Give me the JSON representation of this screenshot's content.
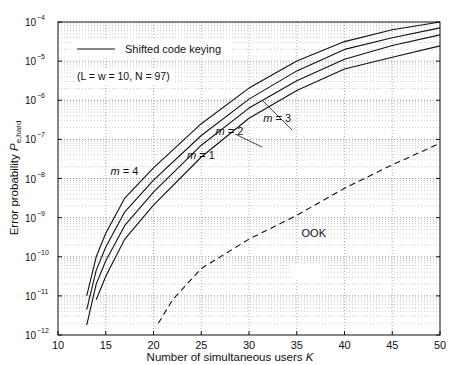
{
  "chart_data": {
    "type": "line",
    "title": "",
    "xlabel": "Number of simultaneous users",
    "xlabel_var": "K",
    "ylabel": "Error probability",
    "ylabel_var": "P",
    "ylabel_sub": "e,hard",
    "xlim": [
      10,
      50
    ],
    "ylim": [
      1e-12,
      0.0001
    ],
    "yscale": "log",
    "x_ticks": [
      10,
      15,
      20,
      25,
      30,
      35,
      40,
      45,
      50
    ],
    "y_tick_exponents": [
      -4,
      -5,
      -6,
      -7,
      -8,
      -9,
      -10,
      -11,
      -12
    ],
    "grid": true,
    "legend": {
      "entries": [
        {
          "label": "Shifted code keying",
          "style": "solid"
        }
      ],
      "params_note": "(L = w = 10, N = 97)",
      "position": "upper-left"
    },
    "series": [
      {
        "name": "m = 4",
        "style": "solid",
        "label_pos": [
          15.5,
          -7.9
        ],
        "x": [
          13,
          14,
          15,
          17,
          20,
          25,
          30,
          35,
          40,
          45,
          50
        ],
        "log10_y": [
          -11.0,
          -10.0,
          -9.4,
          -8.5,
          -7.73,
          -6.6,
          -5.69,
          -5.0,
          -4.5,
          -4.2,
          -4.0
        ]
      },
      {
        "name": "m = 3",
        "style": "solid",
        "label_pos": [
          31.5,
          -6.55
        ],
        "x": [
          13,
          14,
          15,
          17,
          20,
          25,
          30,
          35,
          40,
          45,
          50
        ],
        "log10_y": [
          -11.35,
          -10.35,
          -9.75,
          -8.85,
          -8.04,
          -6.9,
          -5.97,
          -5.25,
          -4.7,
          -4.4,
          -4.15
        ]
      },
      {
        "name": "m = 2",
        "style": "solid",
        "label_pos": [
          26.5,
          -6.9
        ],
        "x": [
          13,
          14,
          15,
          17,
          20,
          25,
          30,
          35,
          40,
          45,
          50
        ],
        "log10_y": [
          -11.75,
          -10.7,
          -10.1,
          -9.2,
          -8.35,
          -7.15,
          -6.2,
          -5.5,
          -4.95,
          -4.6,
          -4.33
        ]
      },
      {
        "name": "m = 1",
        "style": "solid",
        "label_pos": [
          23.5,
          -7.5
        ],
        "x": [
          14,
          15,
          17,
          20,
          25,
          30,
          35,
          40,
          45,
          50
        ],
        "log10_y": [
          -11.1,
          -10.5,
          -9.55,
          -8.68,
          -7.45,
          -6.46,
          -5.75,
          -5.2,
          -4.9,
          -4.61
        ]
      },
      {
        "name": "OOK",
        "style": "dashed",
        "label_pos": [
          35.5,
          -9.5
        ],
        "x": [
          20.5,
          22,
          25,
          30,
          35,
          40,
          45,
          50
        ],
        "log10_y": [
          -11.7,
          -11.1,
          -10.3,
          -9.55,
          -8.94,
          -8.25,
          -7.65,
          -7.1
        ]
      }
    ]
  }
}
